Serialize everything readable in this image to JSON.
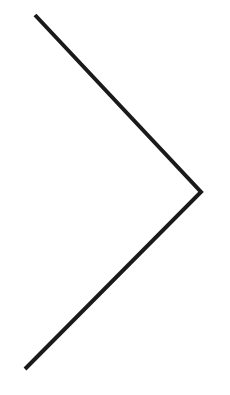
{
  "icon": {
    "name": "chevron-right-icon",
    "stroke_color": "#1a1a1a",
    "background": "#ffffff",
    "stroke_width": 4,
    "points": "35,15 201,192 25,369"
  }
}
